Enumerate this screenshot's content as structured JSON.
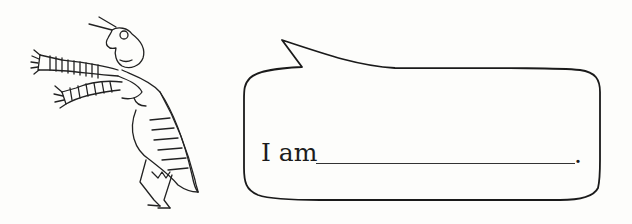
{
  "worksheet": {
    "illustration": "grasshopper-with-striped-scarf",
    "speech_bubble": {
      "prompt_text": "I am",
      "blank_placeholder": "",
      "end_punctuation": "."
    }
  },
  "colors": {
    "paper": "#fdfdfb",
    "ink": "#1c1c1c"
  }
}
